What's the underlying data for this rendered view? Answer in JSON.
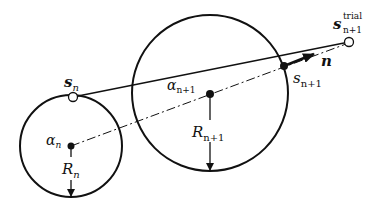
{
  "diagram": {
    "type": "return-mapping-geometry",
    "labels": {
      "s_n": {
        "base": "s",
        "sub": "n"
      },
      "alpha_n": {
        "base": "α",
        "sub": "n"
      },
      "R_n": {
        "base": "R",
        "sub": "n"
      },
      "alpha_n1": {
        "base": "α",
        "sub": "n+1"
      },
      "R_n1": {
        "base": "R",
        "sub": "n+1"
      },
      "s_n1": {
        "base": "s",
        "sub": "n+1"
      },
      "s_trial": {
        "base": "s",
        "sub": "n+1",
        "sup": "trial"
      },
      "normal": "n"
    },
    "colors": {
      "stroke": "#111111",
      "background": "#ffffff"
    }
  }
}
